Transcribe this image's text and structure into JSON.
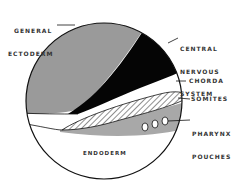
{
  "diagram": {
    "type": "embryo cross-section",
    "colors": {
      "general_ectoderm": "#9a9a9a",
      "central_nervous_system": "#050505",
      "chorda": "#ffffff",
      "somites_hatch": "#222222",
      "endoderm_band": "#a8a8a8",
      "endoderm": "#ffffff",
      "outline": "#111111"
    },
    "labels": {
      "general_ectoderm": [
        "GENERAL",
        "ECTODERM"
      ],
      "central_nervous_system": [
        "CENTRAL",
        "NERVOUS",
        "SYSTEM"
      ],
      "chorda": "CHORDA",
      "somites": "SOMITES",
      "pharynx_pouches": [
        "PHARYNX",
        "POUCHES"
      ],
      "endoderm": "ENDODERM"
    },
    "pharynx_pouch_count": 3
  }
}
